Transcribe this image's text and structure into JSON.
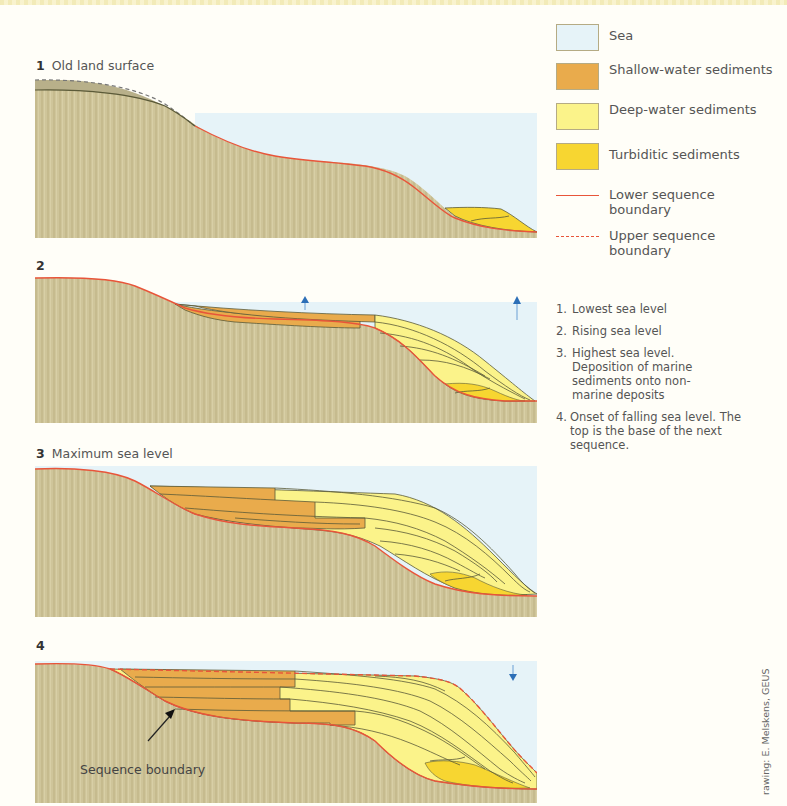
{
  "colors": {
    "land": "#cfc59a",
    "land_stripe": "#c4b98c",
    "sea": "#e6f3f8",
    "shallow_water": "#e9ab4c",
    "deep_water": "#fbf38a",
    "turbiditic": "#f7d631",
    "lower_boundary": "#e8553a",
    "upper_boundary": "#e8553a",
    "bedding": "#5b5a38",
    "arrow": "#2d6fb7"
  },
  "panels": [
    {
      "number": "1",
      "title": "Old land surface",
      "arrows": []
    },
    {
      "number": "2",
      "title": "",
      "arrows": [
        "up",
        "up"
      ]
    },
    {
      "number": "3",
      "title": "Maximum sea level",
      "arrows": []
    },
    {
      "number": "4",
      "title": "",
      "arrows": [
        "down"
      ],
      "callout": "Sequence boundary"
    }
  ],
  "legend": {
    "items": [
      {
        "label": "Sea",
        "type": "swatch",
        "color": "#e6f3f8"
      },
      {
        "label": "Shallow-water sediments",
        "type": "swatch",
        "color": "#e9ab4c"
      },
      {
        "label": "Deep-water sediments",
        "type": "swatch",
        "color": "#fbf38a"
      },
      {
        "label": "Turbiditic sediments",
        "type": "swatch",
        "color": "#f7d631"
      },
      {
        "label": "Lower sequence boundary",
        "type": "solid-line",
        "color": "#e8553a"
      },
      {
        "label": "Upper sequence boundary",
        "type": "dashed-line",
        "color": "#e8553a"
      }
    ]
  },
  "notes": [
    {
      "n": "1.",
      "text": "Lowest sea level"
    },
    {
      "n": "2.",
      "text": "Rising sea level"
    },
    {
      "n": "3.",
      "text": "Highest sea level. Deposition of marine sediments onto non-marine deposits"
    },
    {
      "n": "4.",
      "text": "Onset of falling sea level. The top is the base of the next sequence."
    }
  ],
  "credit": "rawing: E. Melskens, GEUS"
}
